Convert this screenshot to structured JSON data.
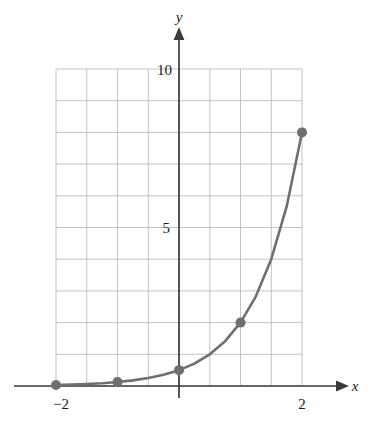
{
  "chart_data": {
    "type": "line",
    "title": "",
    "subtitle": "",
    "xlabel": "x",
    "ylabel": "y",
    "xlim": [
      -2,
      2
    ],
    "ylim": [
      0,
      10
    ],
    "grid": true,
    "grid_x_step": 0.5,
    "grid_y_step": 1,
    "x_tick_labels": [
      "−2",
      "2"
    ],
    "x_tick_values": [
      -2,
      2
    ],
    "y_tick_labels": [
      "5",
      "10"
    ],
    "y_tick_values": [
      5,
      10
    ],
    "legend": null,
    "legend_position": "none",
    "series": [
      {
        "name": "exponential curve",
        "color": "#6f6f6f",
        "line_width": 2.6,
        "marker": "circle",
        "marker_size": 5,
        "x": [
          -2,
          -1,
          0,
          1,
          2
        ],
        "values": [
          0.03,
          0.125,
          0.5,
          2,
          8
        ],
        "curve_samples_x": [
          -2,
          -1.75,
          -1.5,
          -1.25,
          -1,
          -0.75,
          -0.5,
          -0.25,
          0,
          0.25,
          0.5,
          0.75,
          1,
          1.25,
          1.5,
          1.75,
          2
        ],
        "curve_samples_y": [
          0.031,
          0.044,
          0.063,
          0.088,
          0.125,
          0.177,
          0.25,
          0.354,
          0.5,
          0.707,
          1.0,
          1.414,
          2.0,
          2.828,
          4.0,
          5.657,
          8.0
        ]
      }
    ],
    "annotations": []
  },
  "axes": {
    "x_axis_name": "x",
    "y_axis_name": "y",
    "x_axis_arrow": true,
    "y_axis_arrow": true,
    "axis_color": "#3b3b3b",
    "grid_color": "#b8b8bc"
  },
  "colors": {
    "background": "#ffffff",
    "curve": "#6f6f6f",
    "marker": "#6f6f6f",
    "axis": "#3b3b3b",
    "grid": "#bcbcc0",
    "text": "#1a1a1a"
  },
  "labels": {
    "x_neg2": "−2",
    "x_pos2": "2",
    "y_5": "5",
    "y_10": "10",
    "y_name": "y",
    "x_name": "x"
  }
}
